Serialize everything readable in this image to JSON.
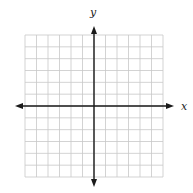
{
  "diagram": {
    "type": "coordinate-plane",
    "x_axis_label": "x",
    "y_axis_label": "y",
    "grid": {
      "columns": 12,
      "rows": 12,
      "left": 25,
      "top": 35,
      "right": 163,
      "bottom": 177,
      "line_color": "#c8c8c8"
    },
    "axes": {
      "color": "#1a1a1a",
      "origin_x": 94,
      "origin_y": 106,
      "x_start": 15,
      "x_end": 174,
      "y_start": 26,
      "y_end": 187
    }
  }
}
